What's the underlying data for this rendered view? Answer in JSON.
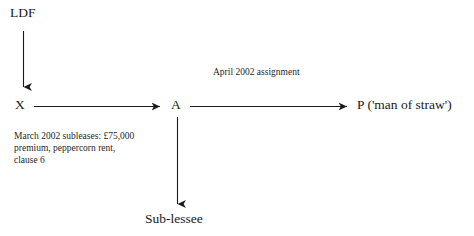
{
  "diagram": {
    "background_color": "#ffffff",
    "line_color": "#1a1a1a",
    "text_color": "#1a1a1a",
    "nodes": [
      {
        "id": "ldf",
        "label": "LDF"
      },
      {
        "id": "x",
        "label": "X"
      },
      {
        "id": "a",
        "label": "A"
      },
      {
        "id": "p",
        "label": "P ('man of straw')"
      },
      {
        "id": "sublessee",
        "label": "Sub-lessee"
      }
    ],
    "annotations": [
      {
        "id": "assignment",
        "text": "April 2002 assignment"
      },
      {
        "id": "subleases",
        "text": "March 2002 subleases: £75,000\npremium, peppercorn rent,\nclause 6"
      }
    ],
    "arrows": [
      {
        "id": "ldf-to-x",
        "from": "LDF",
        "to": "X",
        "direction": "down"
      },
      {
        "id": "x-to-a",
        "from": "X",
        "to": "A",
        "direction": "right"
      },
      {
        "id": "a-to-p",
        "from": "A",
        "to": "P",
        "direction": "right"
      },
      {
        "id": "a-to-sublessee",
        "from": "A",
        "to": "Sub-lessee",
        "direction": "down"
      }
    ]
  }
}
